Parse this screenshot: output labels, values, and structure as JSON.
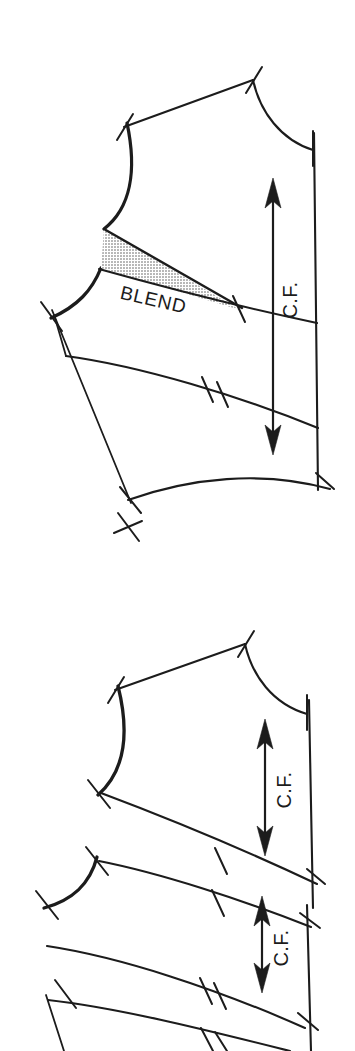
{
  "figure": {
    "background_color": "#ffffff",
    "ink_color": "#1c1c1c",
    "shade_color": "#c9c9c9",
    "width": 355,
    "height": 1051
  },
  "diagrams": [
    {
      "id": "upper",
      "caption": "Bodice front with blended armhole wedge",
      "labels": {
        "blend": "BLEND",
        "grainline": "C.F."
      },
      "markings": {
        "shaded_region": "blend-wedge",
        "grainline_count": 1,
        "notch_pairs": [
          "shoulder",
          "neck-center-front",
          "underarm",
          "style-line",
          "hem-center-front"
        ]
      }
    },
    {
      "id": "lower",
      "caption": "Same bodice divided into yoke bands, each with its own grainline",
      "labels": {
        "grainline_upper": "C.F.",
        "grainline_lower": "C.F."
      },
      "markings": {
        "shaded_region": "none",
        "grainline_count": 2,
        "notch_pairs": [
          "shoulder",
          "neck-center-front",
          "underarm",
          "yoke-seam-single",
          "band-seam-double"
        ]
      }
    }
  ],
  "legend": {
    "blend_note": "BLEND",
    "center_front_note": "C.F."
  }
}
